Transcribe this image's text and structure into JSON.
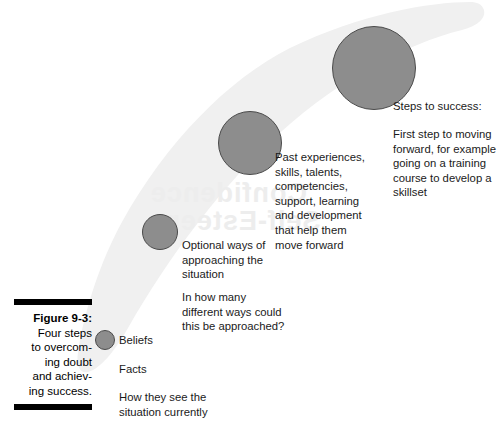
{
  "figure": {
    "caption": {
      "label": "Figure 9-3:",
      "lines": [
        "Four steps",
        "to overcom-",
        "ing doubt",
        "and achiev-",
        "ing success."
      ]
    },
    "watermark": {
      "upper": "Confidence",
      "lower": "Self-Esteem"
    },
    "colors": {
      "circle_fill": "#8d8d8d",
      "circle_stroke": "#4a4a4a",
      "swoosh_fill": "#f0f0f0",
      "caption_rule": "#000000",
      "text": "#1a1a1a",
      "watermark": "#ededed"
    },
    "steps": [
      {
        "id": "beliefs",
        "order": 1,
        "circle": {
          "cx": 105,
          "cy": 340,
          "r": 10
        },
        "label": "Beliefs",
        "sub_label": "Facts",
        "question": "How they see the\nsituation currently"
      },
      {
        "id": "options",
        "order": 2,
        "circle": {
          "cx": 160,
          "cy": 232,
          "r": 18
        },
        "label": "Optional ways of\napproaching the\nsituation",
        "question": "In how many\ndifferent ways could\nthis be approached?"
      },
      {
        "id": "resources",
        "order": 3,
        "circle": {
          "cx": 250,
          "cy": 143,
          "r": 32
        },
        "label": "Past experiences,\nskills, talents,\ncompetencies,\nsupport, learning\nand development\nthat help them\nmove forward"
      },
      {
        "id": "success",
        "order": 4,
        "circle": {
          "cx": 374,
          "cy": 68,
          "r": 42
        },
        "label": "Steps to success:",
        "question": "First step to moving\nforward, for example\ngoing on a training\ncourse to develop a\nskillset"
      }
    ]
  }
}
